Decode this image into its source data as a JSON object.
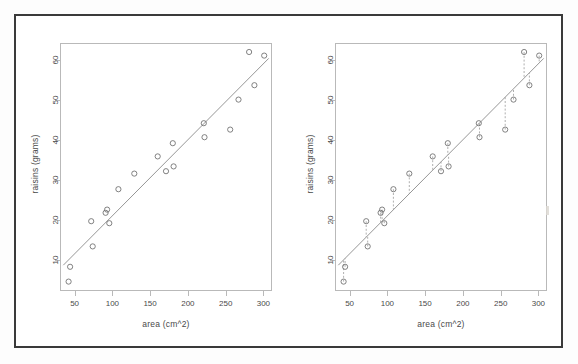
{
  "figure": {
    "background": "#ffffff",
    "frame_color": "#3a3a3a",
    "axis_color": "#b9b9b9",
    "point_color": "#6b6b6b",
    "line_color": "#8a8a8a",
    "residual_color": "#9a9a9a"
  },
  "chart_data": [
    {
      "id": "left-panel",
      "type": "scatter",
      "title": "",
      "xlabel": "area (cm^2)",
      "ylabel": "raisins (grams)",
      "xlim": [
        32,
        310
      ],
      "ylim": [
        2.5,
        64
      ],
      "xticks": [
        50,
        100,
        150,
        200,
        250,
        300
      ],
      "yticks": [
        10,
        20,
        30,
        40,
        50,
        60
      ],
      "grid": false,
      "legend": "none",
      "show_residuals": false,
      "points": [
        {
          "x": 42,
          "y": 4.6
        },
        {
          "x": 44,
          "y": 8.3
        },
        {
          "x": 72,
          "y": 19.7
        },
        {
          "x": 74,
          "y": 13.4
        },
        {
          "x": 91,
          "y": 21.8
        },
        {
          "x": 93,
          "y": 22.6
        },
        {
          "x": 96,
          "y": 19.2
        },
        {
          "x": 108,
          "y": 27.7
        },
        {
          "x": 129,
          "y": 31.6
        },
        {
          "x": 160,
          "y": 35.9
        },
        {
          "x": 171,
          "y": 32.2
        },
        {
          "x": 180,
          "y": 39.2
        },
        {
          "x": 181,
          "y": 33.4
        },
        {
          "x": 221,
          "y": 44.2
        },
        {
          "x": 222,
          "y": 40.7
        },
        {
          "x": 256,
          "y": 42.6
        },
        {
          "x": 267,
          "y": 50.1
        },
        {
          "x": 281,
          "y": 62.0
        },
        {
          "x": 288,
          "y": 53.7
        },
        {
          "x": 301,
          "y": 61.1
        }
      ],
      "fit_line": {
        "type": "linear",
        "x0": 35,
        "y0": 8.7,
        "x1": 307,
        "y1": 60.4
      }
    },
    {
      "id": "right-panel",
      "type": "scatter",
      "title": "",
      "xlabel": "area (cm^2)",
      "ylabel": "raisins (grams)",
      "xlim": [
        32,
        310
      ],
      "ylim": [
        2.5,
        64
      ],
      "xticks": [
        50,
        100,
        150,
        200,
        250,
        300
      ],
      "yticks": [
        10,
        20,
        30,
        40,
        50,
        60
      ],
      "grid": false,
      "legend": "none",
      "show_residuals": true,
      "points": [
        {
          "x": 42,
          "y": 4.6
        },
        {
          "x": 44,
          "y": 8.3
        },
        {
          "x": 72,
          "y": 19.7
        },
        {
          "x": 74,
          "y": 13.4
        },
        {
          "x": 91,
          "y": 21.8
        },
        {
          "x": 93,
          "y": 22.6
        },
        {
          "x": 96,
          "y": 19.2
        },
        {
          "x": 108,
          "y": 27.7
        },
        {
          "x": 129,
          "y": 31.6
        },
        {
          "x": 160,
          "y": 35.9
        },
        {
          "x": 171,
          "y": 32.2
        },
        {
          "x": 180,
          "y": 39.2
        },
        {
          "x": 181,
          "y": 33.4
        },
        {
          "x": 221,
          "y": 44.2
        },
        {
          "x": 222,
          "y": 40.7
        },
        {
          "x": 256,
          "y": 42.6
        },
        {
          "x": 267,
          "y": 50.1
        },
        {
          "x": 281,
          "y": 62.0
        },
        {
          "x": 288,
          "y": 53.7
        },
        {
          "x": 301,
          "y": 61.1
        }
      ],
      "fit_line": {
        "type": "linear",
        "x0": 35,
        "y0": 8.7,
        "x1": 307,
        "y1": 60.4
      }
    }
  ]
}
